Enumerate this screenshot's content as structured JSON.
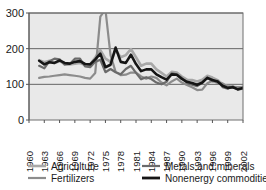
{
  "chart_data": {
    "type": "line",
    "title": "",
    "xlabel": "",
    "ylabel": "",
    "xlim": [
      1960,
      2002
    ],
    "ylim": [
      0,
      300
    ],
    "grid": true,
    "legend_position": "bottom",
    "ytick_labels": [
      "0",
      "100",
      "200",
      "300"
    ],
    "ytick_values": [
      0,
      100,
      200,
      300
    ],
    "xtick_labels": [
      "1960",
      "1963",
      "1966",
      "1969",
      "1972",
      "1975",
      "1978",
      "1981",
      "1984",
      "1987",
      "1990",
      "1993",
      "1996",
      "1999",
      "2002"
    ],
    "xtick_values": [
      1960,
      1963,
      1966,
      1969,
      1972,
      1975,
      1978,
      1981,
      1984,
      1987,
      1990,
      1993,
      1996,
      1999,
      2002
    ],
    "x": [
      1962,
      1963,
      1964,
      1965,
      1966,
      1967,
      1968,
      1969,
      1970,
      1971,
      1972,
      1973,
      1974,
      1975,
      1976,
      1977,
      1978,
      1979,
      1980,
      1981,
      1982,
      1983,
      1984,
      1985,
      1986,
      1987,
      1988,
      1989,
      1990,
      1991,
      1992,
      1993,
      1994,
      1995,
      1996,
      1997,
      1998,
      1999,
      2000,
      2001,
      2002
    ],
    "series": [
      {
        "name": "Agriculture",
        "color": "#a8a8a8",
        "width": 2.6,
        "values": [
          168,
          162,
          166,
          160,
          165,
          158,
          156,
          158,
          160,
          154,
          156,
          175,
          196,
          172,
          163,
          196,
          176,
          182,
          199,
          176,
          152,
          158,
          158,
          142,
          132,
          122,
          135,
          133,
          122,
          113,
          112,
          108,
          113,
          124,
          119,
          112,
          100,
          95,
          93,
          90,
          93
        ]
      },
      {
        "name": "Fertilizers",
        "color": "#8c8c8c",
        "width": 2.2,
        "values": [
          118,
          121,
          122,
          124,
          126,
          128,
          126,
          124,
          122,
          118,
          116,
          132,
          290,
          310,
          182,
          135,
          126,
          127,
          133,
          133,
          122,
          116,
          122,
          118,
          105,
          97,
          108,
          116,
          105,
          98,
          92,
          84,
          85,
          103,
          110,
          104,
          103,
          92,
          93,
          92,
          92
        ]
      },
      {
        "name": "Metals and minerals",
        "color": "#6b6b6b",
        "width": 2.2,
        "values": [
          152,
          145,
          165,
          172,
          170,
          155,
          157,
          172,
          172,
          150,
          148,
          163,
          169,
          134,
          143,
          134,
          128,
          143,
          152,
          132,
          114,
          120,
          115,
          105,
          100,
          107,
          131,
          128,
          118,
          104,
          99,
          95,
          104,
          119,
          108,
          110,
          92,
          88,
          94,
          85,
          88
        ]
      },
      {
        "name": "Nonenergy commodities",
        "color": "#151515",
        "width": 2.6,
        "values": [
          166,
          156,
          162,
          160,
          167,
          160,
          158,
          163,
          165,
          157,
          156,
          170,
          186,
          148,
          155,
          203,
          163,
          160,
          183,
          157,
          137,
          142,
          142,
          128,
          120,
          113,
          128,
          127,
          115,
          107,
          104,
          99,
          105,
          118,
          112,
          108,
          96,
          90,
          92,
          86,
          90
        ]
      }
    ]
  },
  "legend": {
    "entries": [
      {
        "label": "Agriculture",
        "color": "#a8a8a8"
      },
      {
        "label": "Metals and minerals",
        "color": "#6b6b6b"
      },
      {
        "label": "Fertilizers",
        "color": "#8c8c8c"
      },
      {
        "label": "Nonenergy commodities",
        "color": "#151515"
      }
    ]
  }
}
